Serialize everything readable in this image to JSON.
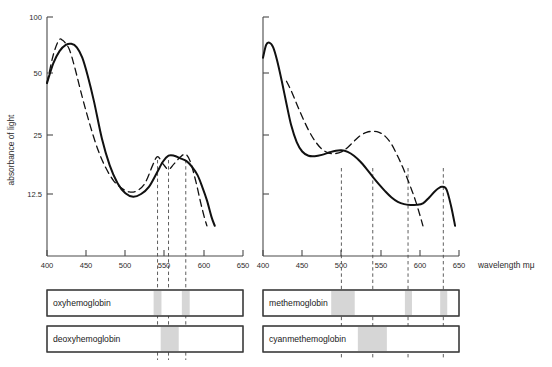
{
  "figure": {
    "background": "#ffffff",
    "line_color": "#111111",
    "band_color": "#d6d6d6",
    "axis_color": "#4a4a4a"
  },
  "chart_data": [
    {
      "type": "line",
      "title": "",
      "panel": "left",
      "xlabel": "",
      "ylabel": "absorbance of light",
      "xlim": [
        400,
        650
      ],
      "ylim": [
        8,
        100
      ],
      "yscale": "log",
      "grid": false,
      "legend_position": "below-chart-boxes",
      "xticks": [
        400,
        450,
        500,
        550,
        600,
        650
      ],
      "xticklabels": [
        "400",
        "450",
        "500",
        "550",
        "600",
        "650"
      ],
      "yticks": [
        100,
        50,
        25,
        12.5
      ],
      "yticklabels": [
        "100",
        "50",
        "25",
        "12.5"
      ],
      "annotations": [
        "541",
        "555",
        "577"
      ],
      "vlines": [
        541,
        555,
        577
      ],
      "series": [
        {
          "name": "oxyhemoglobin",
          "style": "dashed",
          "x": [
            400,
            408,
            415,
            420,
            428,
            435,
            445,
            455,
            465,
            475,
            485,
            495,
            505,
            515,
            525,
            535,
            541,
            548,
            555,
            562,
            570,
            577,
            583,
            590,
            596,
            601,
            604
          ],
          "y": [
            46,
            64,
            76,
            76,
            69,
            56,
            39,
            28,
            21,
            17,
            14.6,
            13.4,
            12.8,
            13.0,
            14.2,
            17.6,
            19.4,
            17.8,
            16.7,
            17.8,
            19.3,
            19.9,
            18.2,
            14.4,
            11.3,
            9.4,
            8.6
          ]
        },
        {
          "name": "deoxyhemoglobin",
          "style": "solid",
          "x": [
            400,
            408,
            416,
            424,
            431,
            438,
            445,
            452,
            460,
            470,
            480,
            490,
            500,
            510,
            520,
            530,
            540,
            548,
            555,
            562,
            570,
            578,
            585,
            592,
            598,
            604,
            610,
            614
          ],
          "y": [
            46,
            58,
            67,
            72,
            73,
            70,
            62,
            50,
            37,
            24,
            17.5,
            14.2,
            12.6,
            12.1,
            12.5,
            13.6,
            16.0,
            18.3,
            19.6,
            19.6,
            19.0,
            18.4,
            17.2,
            15.6,
            13.6,
            11.6,
            9.5,
            8.6
          ]
        }
      ]
    },
    {
      "type": "line",
      "title": "",
      "panel": "right",
      "xlabel": "wavelength mμ",
      "ylabel": "",
      "xlim": [
        400,
        650
      ],
      "ylim": [
        8,
        100
      ],
      "yscale": "log",
      "grid": false,
      "legend_position": "below-chart-boxes",
      "xticks": [
        400,
        450,
        500,
        550,
        600,
        650
      ],
      "xticklabels": [
        "400",
        "450",
        "500",
        "550",
        "600",
        "650"
      ],
      "yticks": [
        100,
        50,
        25,
        12.5
      ],
      "yticklabels": [
        "",
        "",
        "",
        ""
      ],
      "vlines": [
        500,
        540,
        585,
        630
      ],
      "series": [
        {
          "name": "methemoglobin",
          "style": "solid",
          "x": [
            400,
            404,
            408,
            413,
            418,
            424,
            430,
            436,
            443,
            450,
            458,
            466,
            475,
            485,
            493,
            500,
            508,
            516,
            524,
            532,
            540,
            548,
            556,
            564,
            572,
            580,
            588,
            596,
            604,
            612,
            620,
            628,
            634,
            640,
            645
          ],
          "y": [
            62,
            72,
            74,
            70,
            60,
            47,
            36,
            28,
            23,
            20.6,
            19.6,
            19.5,
            19.8,
            20.4,
            20.8,
            20.9,
            20.5,
            19.6,
            18.3,
            16.8,
            15.3,
            14.0,
            12.9,
            12.0,
            11.4,
            11.1,
            11.0,
            11.0,
            11.2,
            12.0,
            13.0,
            13.6,
            13.2,
            10.8,
            8.6
          ]
        },
        {
          "name": "cyanmethemoglobin",
          "style": "dashed",
          "x": [
            430,
            436,
            443,
            450,
            458,
            466,
            475,
            484,
            492,
            500,
            508,
            516,
            524,
            532,
            540,
            548,
            556,
            564,
            572,
            578,
            584,
            590,
            595,
            600,
            604
          ],
          "y": [
            47,
            42,
            36,
            31,
            26.5,
            23.4,
            21.2,
            20.2,
            20.1,
            20.5,
            21.6,
            23.2,
            24.8,
            25.8,
            26.1,
            25.8,
            24.6,
            22.4,
            19.4,
            17.2,
            15.0,
            13.0,
            11.4,
            9.8,
            8.6
          ]
        }
      ]
    }
  ],
  "legend_boxes": [
    {
      "label": "oxyhemoglobin",
      "panel": "left",
      "row": 0,
      "bands": [
        {
          "start": 536,
          "end": 546
        },
        {
          "start": 572,
          "end": 582
        }
      ]
    },
    {
      "label": "deoxyhemoglobin",
      "panel": "left",
      "row": 1,
      "bands": [
        {
          "start": 545,
          "end": 568
        }
      ]
    },
    {
      "label": "methemoglobin",
      "panel": "right",
      "row": 0,
      "bands": [
        {
          "start": 487,
          "end": 517
        },
        {
          "start": 581,
          "end": 590
        },
        {
          "start": 626,
          "end": 635
        }
      ]
    },
    {
      "label": "cyanmethemoglobin",
      "panel": "right",
      "row": 1,
      "bands": [
        {
          "start": 521,
          "end": 558
        }
      ]
    }
  ]
}
